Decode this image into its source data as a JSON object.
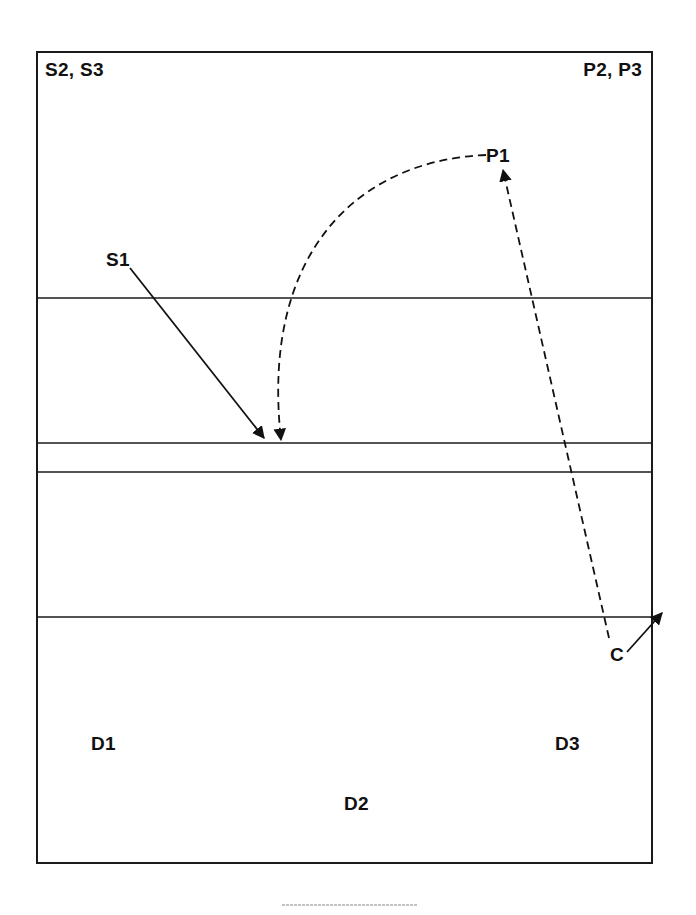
{
  "diagram": {
    "title": "",
    "frame": {
      "x": 37,
      "y": 52,
      "width": 615,
      "height": 811,
      "stroke": "#1a1a1a"
    },
    "zone_lines": [
      {
        "id": "line-1",
        "y": 298
      },
      {
        "id": "line-2",
        "y": 443
      },
      {
        "id": "line-3",
        "y": 472
      },
      {
        "id": "line-4",
        "y": 617
      }
    ],
    "labels": {
      "top_left": "S2, S3",
      "top_right": "P2, P3",
      "s1": "S1",
      "p1": "P1",
      "c": "C",
      "d1": "D1",
      "d2": "D2",
      "d3": "D3"
    },
    "paths": [
      {
        "id": "s1-arrow",
        "from": "S1",
        "to": "line-2",
        "style": "solid",
        "arrowhead": "end"
      },
      {
        "id": "p1-arc",
        "from": "P1",
        "to": "line-2",
        "style": "dashed",
        "arrowhead": "end"
      },
      {
        "id": "c-to-p1",
        "from": "C",
        "to": "P1",
        "style": "dashed",
        "arrowhead": "end"
      },
      {
        "id": "c-exit-arrow",
        "from": "C",
        "to": "outside-right",
        "style": "solid",
        "arrowhead": "end"
      }
    ],
    "colors": {
      "ink": "#111111",
      "background": "#ffffff"
    }
  }
}
